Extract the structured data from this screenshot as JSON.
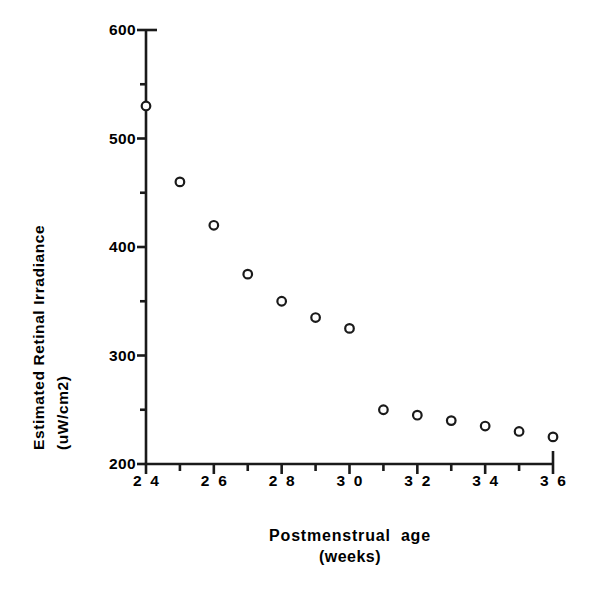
{
  "chart_data": {
    "type": "scatter",
    "title": "",
    "xlabel": "Postmenstrual age",
    "xlabel_sub": "(weeks)",
    "ylabel": "Estimated  Retinal  Irradiance",
    "ylabel_sub": "(uW/cm2)",
    "xlim": [
      24,
      36
    ],
    "ylim": [
      200,
      600
    ],
    "x_major_ticks": [
      24,
      26,
      28,
      30,
      32,
      34,
      36
    ],
    "x_minor_ticks": [
      25,
      27,
      29,
      31,
      33,
      35
    ],
    "x_tick_labels": [
      "2 4",
      "2 6",
      "2 8",
      "3 0",
      "3 2",
      "3 4",
      "3 6"
    ],
    "y_major_ticks": [
      200,
      300,
      400,
      500,
      600
    ],
    "y_minor_ticks": [
      250,
      350,
      450,
      550
    ],
    "y_tick_labels": [
      "200",
      "300",
      "400",
      "500",
      "600"
    ],
    "grid": false,
    "legend": false,
    "marker": "open-circle",
    "marker_color": "#1a1a1a",
    "marker_fill": "#ffffff",
    "x": [
      24,
      25,
      26,
      27,
      28,
      29,
      30,
      31,
      32,
      33,
      34,
      35,
      36
    ],
    "values": [
      530,
      460,
      420,
      375,
      350,
      335,
      325,
      250,
      245,
      240,
      235,
      230,
      225
    ],
    "points": [
      {
        "x": 24,
        "y": 530
      },
      {
        "x": 25,
        "y": 460
      },
      {
        "x": 26,
        "y": 420
      },
      {
        "x": 27,
        "y": 375
      },
      {
        "x": 28,
        "y": 350
      },
      {
        "x": 29,
        "y": 335
      },
      {
        "x": 30,
        "y": 325
      },
      {
        "x": 31,
        "y": 250
      },
      {
        "x": 32,
        "y": 245
      },
      {
        "x": 33,
        "y": 240
      },
      {
        "x": 34,
        "y": 235
      },
      {
        "x": 35,
        "y": 230
      },
      {
        "x": 36,
        "y": 225
      }
    ]
  },
  "axes": {
    "line_color": "#1a1a1a",
    "background": "#ffffff"
  }
}
